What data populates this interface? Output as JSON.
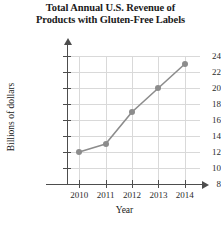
{
  "chart_data": {
    "type": "line",
    "title": "Total Annual U.S. Revenue of Products with Gluten-Free Labels",
    "title_line1": "Total Annual U.S. Revenue of",
    "title_line2": "Products with Gluten-Free Labels",
    "xlabel": "Year",
    "ylabel": "Billions of dollars",
    "categories": [
      "2010",
      "2011",
      "2012",
      "2013",
      "2014"
    ],
    "values": [
      12,
      13,
      17,
      20,
      23
    ],
    "ylim": [
      8,
      24
    ],
    "yticks": [
      8,
      10,
      12,
      14,
      16,
      18,
      20,
      22,
      24
    ],
    "ytick_labels": [
      "8",
      "10",
      "12",
      "14",
      "16",
      "18",
      "20",
      "22",
      "24"
    ],
    "xtick_labels": [
      "2010",
      "2011",
      "2012",
      "2013",
      "2014"
    ],
    "grid": true,
    "legend": false,
    "series_color": "#8c8c8c",
    "grid_color": "#d9d9d9",
    "axis_color": "#4d4d4d"
  }
}
